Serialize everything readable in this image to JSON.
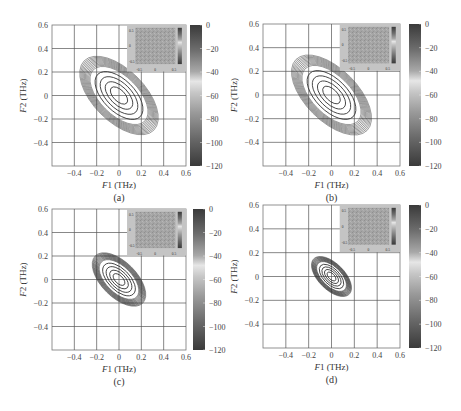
{
  "figure": {
    "panels": [
      {
        "id": "a",
        "label": "(a)",
        "x0": 52,
        "y0": 25,
        "w": 134,
        "h": 141,
        "cbx": 190,
        "ellipse": {
          "cx": 0.0,
          "cy": 0.0,
          "a_max": 0.44,
          "b_max": 0.22,
          "angle_deg": -45,
          "n": 14
        }
      },
      {
        "id": "b",
        "label": "(b)",
        "x0": 263,
        "y0": 24,
        "w": 137,
        "h": 142,
        "cbx": 409,
        "ellipse": {
          "cx": 0.0,
          "cy": 0.0,
          "a_max": 0.44,
          "b_max": 0.22,
          "angle_deg": -45,
          "n": 14
        }
      },
      {
        "id": "c",
        "label": "(c)",
        "x0": 52,
        "y0": 209,
        "w": 134,
        "h": 141,
        "cbx": 193,
        "ellipse": {
          "cx": 0.0,
          "cy": 0.0,
          "a_max": 0.3,
          "b_max": 0.15,
          "angle_deg": -45,
          "n": 16
        }
      },
      {
        "id": "d",
        "label": "(d)",
        "x0": 263,
        "y0": 205,
        "w": 137,
        "h": 143,
        "cbx": 409,
        "ellipse": {
          "cx": 0.0,
          "cy": 0.0,
          "a_max": 0.22,
          "b_max": 0.11,
          "angle_deg": -45,
          "n": 16
        }
      }
    ],
    "colors": {
      "grid": "#555555",
      "contour": "#333333",
      "inset_bg": "#a8a8a8"
    }
  },
  "chart_data": [
    {
      "type": "heatmap",
      "subtype": "contour",
      "title": "(a)",
      "xlabel": "F1 (THz)",
      "ylabel": "F2 (THz)",
      "xlim": [
        -0.6,
        0.6
      ],
      "ylim": [
        -0.6,
        0.6
      ],
      "xticks": [
        "-0.4",
        "-0.2",
        "0",
        "0.2",
        "0.4",
        "0.6"
      ],
      "yticks": [
        "0.6",
        "0.4",
        "0.2",
        "0",
        "-0.2",
        "-0.4"
      ],
      "colorbar": {
        "min": -120,
        "max": 0,
        "ticks": [
          "0",
          "-20",
          "-40",
          "-60",
          "-80",
          "-100",
          "-120"
        ]
      },
      "contour": {
        "shape": "ellipse",
        "center": [
          0,
          0
        ],
        "orientation": "anti-diagonal",
        "outer_extent_F1": [
          -0.35,
          0.35
        ],
        "outer_extent_F2": [
          -0.35,
          0.35
        ]
      },
      "inset": {
        "xticks": [
          "-0.5",
          "0",
          "0.5"
        ],
        "yticks": [
          "0.5",
          "0",
          "-0.5"
        ]
      },
      "grid": true
    },
    {
      "type": "heatmap",
      "subtype": "contour",
      "title": "(b)",
      "xlabel": "F1 (THz)",
      "ylabel": "F2 (THz)",
      "xlim": [
        -0.6,
        0.6
      ],
      "ylim": [
        -0.6,
        0.6
      ],
      "xticks": [
        "-0.4",
        "-0.2",
        "0",
        "0.2",
        "0.4",
        "0.6"
      ],
      "yticks": [
        "0.6",
        "0.4",
        "0.2",
        "0",
        "-0.2",
        "-0.4"
      ],
      "colorbar": {
        "min": -120,
        "max": 0,
        "ticks": [
          "0",
          "-20",
          "-40",
          "-60",
          "-80",
          "-100",
          "-120"
        ]
      },
      "contour": {
        "shape": "ellipse",
        "center": [
          0,
          0
        ],
        "orientation": "anti-diagonal",
        "outer_extent_F1": [
          -0.35,
          0.35
        ],
        "outer_extent_F2": [
          -0.35,
          0.35
        ]
      },
      "inset": {
        "xticks": [
          "-0.5",
          "0",
          "0.5"
        ],
        "yticks": [
          "0.5",
          "0",
          "-0.5"
        ]
      },
      "grid": true
    },
    {
      "type": "heatmap",
      "subtype": "contour",
      "title": "(c)",
      "xlabel": "F1 (THz)",
      "ylabel": "F2 (THz)",
      "xlim": [
        -0.6,
        0.6
      ],
      "ylim": [
        -0.6,
        0.6
      ],
      "xticks": [
        "-0.4",
        "-0.2",
        "0",
        "0.2",
        "0.4",
        "0.6"
      ],
      "yticks": [
        "0.6",
        "0.4",
        "0.2",
        "0",
        "-0.2",
        "-0.4"
      ],
      "colorbar": {
        "min": -120,
        "max": 0,
        "ticks": [
          "0",
          "-20",
          "-40",
          "-60",
          "-80",
          "-100",
          "-120"
        ]
      },
      "contour": {
        "shape": "ellipse",
        "center": [
          0,
          0
        ],
        "orientation": "anti-diagonal",
        "outer_extent_F1": [
          -0.24,
          0.24
        ],
        "outer_extent_F2": [
          -0.24,
          0.24
        ]
      },
      "inset": {
        "xticks": [
          "-0.5",
          "0",
          "0.5"
        ],
        "yticks": [
          "0.5",
          "0",
          "-0.5"
        ]
      },
      "grid": true
    },
    {
      "type": "heatmap",
      "subtype": "contour",
      "title": "(d)",
      "xlabel": "F1 (THz)",
      "ylabel": "F2 (THz)",
      "xlim": [
        -0.6,
        0.6
      ],
      "ylim": [
        -0.6,
        0.6
      ],
      "xticks": [
        "-0.4",
        "-0.2",
        "0",
        "0.2",
        "0.4",
        "0.6"
      ],
      "yticks": [
        "0.6",
        "0.4",
        "0.2",
        "0",
        "-0.2",
        "-0.4"
      ],
      "colorbar": {
        "min": -120,
        "max": 0,
        "ticks": [
          "0",
          "-20",
          "-40",
          "-60",
          "-80",
          "-100",
          "-120"
        ]
      },
      "contour": {
        "shape": "ellipse",
        "center": [
          0,
          0
        ],
        "orientation": "anti-diagonal",
        "outer_extent_F1": [
          -0.18,
          0.18
        ],
        "outer_extent_F2": [
          -0.18,
          0.18
        ]
      },
      "inset": {
        "xticks": [
          "-0.5",
          "0",
          "0.5"
        ],
        "yticks": [
          "0.5",
          "0",
          "-0.5"
        ]
      },
      "grid": true
    }
  ]
}
